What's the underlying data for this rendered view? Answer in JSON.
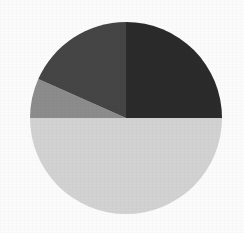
{
  "figure": {
    "name": "pie-chart-figure",
    "background_color": "#fbfbfb",
    "width": 244,
    "height": 233
  },
  "geometry": {
    "center_x": 126,
    "center_y": 118,
    "radius": 96
  },
  "chart_data": {
    "type": "pie",
    "title": "",
    "subtitle": "",
    "xlabel": "",
    "ylabel": "",
    "grid": false,
    "legend": "none",
    "start_angle_deg": 0,
    "direction": "clockwise",
    "total": 100,
    "categories": [
      "Segment 1",
      "Segment 2",
      "Segment 3",
      "Segment 4"
    ],
    "values": [
      25,
      50,
      7,
      18
    ],
    "colors": [
      "#2b2b2b",
      "#d2d2d2",
      "#8c8c8c",
      "#454545"
    ],
    "slices": [
      {
        "label": "Segment 1",
        "value": 25,
        "percent": 25,
        "color": "#2b2b2b",
        "start_angle_deg": 0,
        "end_angle_deg": 90,
        "shade": "near-black"
      },
      {
        "label": "Segment 2",
        "value": 50,
        "percent": 50,
        "color": "#d2d2d2",
        "start_angle_deg": 90,
        "end_angle_deg": 270,
        "shade": "light-gray"
      },
      {
        "label": "Segment 3",
        "value": 7,
        "percent": 7,
        "color": "#8c8c8c",
        "start_angle_deg": 270,
        "end_angle_deg": 294,
        "shade": "medium-gray"
      },
      {
        "label": "Segment 4",
        "value": 18,
        "percent": 18,
        "color": "#454545",
        "start_angle_deg": 294,
        "end_angle_deg": 360,
        "shade": "dark-gray"
      }
    ]
  }
}
